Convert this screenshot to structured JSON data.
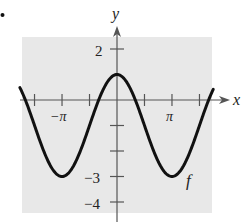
{
  "chart_data": {
    "type": "line",
    "title": "",
    "xlabel": "x",
    "ylabel": "y",
    "function_label": "f",
    "function": "f(x) = 2cos(x) - 1",
    "x_ticks": [
      {
        "value": -5.4978,
        "label": ""
      },
      {
        "value": -4.7124,
        "label": ""
      },
      {
        "value": -3.1416,
        "label": "−π"
      },
      {
        "value": -1.5708,
        "label": ""
      },
      {
        "value": 1.5708,
        "label": ""
      },
      {
        "value": 3.1416,
        "label": "π"
      },
      {
        "value": 4.7124,
        "label": ""
      }
    ],
    "y_ticks": [
      {
        "value": 2,
        "label": "2"
      },
      {
        "value": -1,
        "label": ""
      },
      {
        "value": -2,
        "label": ""
      },
      {
        "value": -3,
        "label": "−3"
      },
      {
        "value": -4,
        "label": "−4"
      }
    ],
    "xlim": [
      -5.55,
      5.5
    ],
    "ylim": [
      -4.5,
      2.5
    ],
    "key_points": [
      {
        "x": -3.1416,
        "y": -3
      },
      {
        "x": 0,
        "y": 1
      },
      {
        "x": 3.1416,
        "y": -3
      }
    ],
    "grid": false,
    "background": "#e8e8e8",
    "curve_color": "#111111"
  },
  "labels": {
    "x_axis": "x",
    "y_axis": "y",
    "curve": "f",
    "x_neg_pi": "−π",
    "x_pi": "π",
    "y_2": "2",
    "y_neg3": "−3",
    "y_neg4": "−4"
  }
}
